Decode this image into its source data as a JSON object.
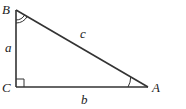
{
  "diagram": {
    "type": "right-triangle",
    "vertices": {
      "B": {
        "label": "B",
        "angle_mark": "double-arc"
      },
      "C": {
        "label": "C",
        "angle_mark": "right-angle"
      },
      "A": {
        "label": "A",
        "angle_mark": "single-arc"
      }
    },
    "sides": {
      "a": {
        "label": "a",
        "between": "B-C"
      },
      "b": {
        "label": "b",
        "between": "C-A"
      },
      "c": {
        "label": "c",
        "between": "B-A"
      }
    },
    "line_color": "#333333"
  }
}
